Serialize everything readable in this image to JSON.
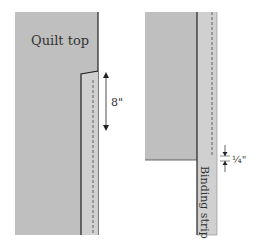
{
  "figure": {
    "left_panel": {
      "quilt_label": "Quilt top",
      "measure_label": "8\""
    },
    "right_panel": {
      "strip_label": "Binding strip",
      "seam_label": "¼\""
    }
  },
  "colors": {
    "quilt_fill": "#bfbfbf",
    "strip_fill": "#d0d0d0",
    "line": "#222222",
    "dash": "#555555"
  }
}
